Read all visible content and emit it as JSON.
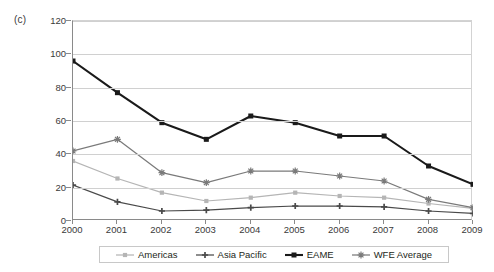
{
  "figure": {
    "panel_label": "(c)"
  },
  "chart_data": {
    "type": "line",
    "title": "",
    "subtitle": "",
    "xlabel": "",
    "ylabel": "",
    "categories": [
      "2000",
      "2001",
      "2002",
      "2003",
      "2004",
      "2005",
      "2006",
      "2007",
      "2008",
      "2009"
    ],
    "x": [
      2000,
      2001,
      2002,
      2003,
      2004,
      2005,
      2006,
      2007,
      2008,
      2009
    ],
    "ylim": [
      0,
      120
    ],
    "ytick_labels": [
      "0",
      "20",
      "40",
      "60",
      "80",
      "100",
      "120"
    ],
    "yticks": [
      0,
      20,
      40,
      60,
      80,
      100,
      120
    ],
    "grid": true,
    "legend_position": "bottom",
    "series": [
      {
        "name": "Americas",
        "color": "#b5b5b5",
        "marker": "square",
        "values": [
          36,
          25.5,
          17,
          12,
          14,
          17,
          15,
          14,
          10.5,
          7.5
        ]
      },
      {
        "name": "Asia Pacific",
        "color": "#4a4a4a",
        "marker": "plus",
        "values": [
          21.5,
          11.5,
          6,
          6.5,
          8,
          9,
          9,
          8.5,
          6,
          4.5
        ]
      },
      {
        "name": "EAME",
        "color": "#1a1a1a",
        "marker": "square",
        "values": [
          96,
          77,
          59,
          49,
          63,
          59,
          51,
          51,
          33,
          22
        ]
      },
      {
        "name": "WFE Average",
        "color": "#7a7a7a",
        "marker": "star",
        "values": [
          42,
          49,
          29,
          23,
          30,
          30,
          27,
          24,
          13,
          8
        ]
      }
    ]
  },
  "legend": {
    "items": [
      {
        "label": "Americas"
      },
      {
        "label": "Asia Pacific"
      },
      {
        "label": "EAME"
      },
      {
        "label": "WFE Average"
      }
    ]
  }
}
